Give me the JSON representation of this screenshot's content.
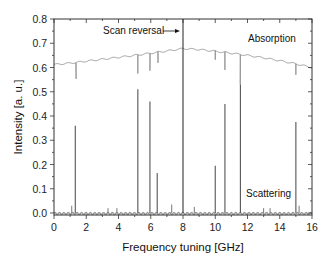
{
  "chart_data": {
    "type": "line",
    "title": "",
    "xlabel": "Frequency tuning [GHz]",
    "ylabel": "Intensity [a. u.]",
    "xlim": [
      0,
      16
    ],
    "ylim": [
      0.0,
      0.8
    ],
    "xticks": [
      "0",
      "2",
      "4",
      "6",
      "8",
      "10",
      "12",
      "14",
      "16"
    ],
    "yticks": [
      "0.0",
      "0.1",
      "0.2",
      "0.3",
      "0.4",
      "0.5",
      "0.6",
      "0.7",
      "0.8"
    ],
    "grid": false,
    "legend": null,
    "annotations": [
      {
        "text": "Scan reversal",
        "x": 8.0,
        "type": "vertical-line-with-arrow"
      },
      {
        "text": "Absorption",
        "x": 13.3,
        "y": 0.74
      },
      {
        "text": "Scattering",
        "x": 13.3,
        "y": 0.07
      }
    ],
    "series": [
      {
        "name": "Absorption",
        "baseline": {
          "x": [
            0,
            1,
            2,
            3,
            4,
            5,
            6,
            7,
            8,
            9,
            10,
            11,
            12,
            13,
            14,
            15,
            16
          ],
          "y": [
            0.612,
            0.618,
            0.626,
            0.634,
            0.642,
            0.65,
            0.659,
            0.668,
            0.678,
            0.674,
            0.667,
            0.659,
            0.65,
            0.64,
            0.628,
            0.615,
            0.6
          ]
        },
        "dips": [
          {
            "x": 1.37,
            "y": 0.553
          },
          {
            "x": 5.2,
            "y": 0.575
          },
          {
            "x": 5.95,
            "y": 0.587
          },
          {
            "x": 6.45,
            "y": 0.619
          },
          {
            "x": 10.0,
            "y": 0.632
          },
          {
            "x": 10.6,
            "y": 0.59
          },
          {
            "x": 11.55,
            "y": 0.53
          },
          {
            "x": 15.0,
            "y": 0.57
          }
        ]
      },
      {
        "name": "Scattering",
        "baseline": 0.0,
        "peaks": [
          {
            "x": 1.1,
            "y": 0.03
          },
          {
            "x": 1.32,
            "y": 0.36
          },
          {
            "x": 3.35,
            "y": 0.02
          },
          {
            "x": 3.9,
            "y": 0.02
          },
          {
            "x": 5.2,
            "y": 0.51
          },
          {
            "x": 5.95,
            "y": 0.46
          },
          {
            "x": 6.4,
            "y": 0.165
          },
          {
            "x": 7.3,
            "y": 0.035
          },
          {
            "x": 8.7,
            "y": 0.025
          },
          {
            "x": 10.0,
            "y": 0.195
          },
          {
            "x": 10.6,
            "y": 0.45
          },
          {
            "x": 11.56,
            "y": 0.53
          },
          {
            "x": 13.0,
            "y": 0.02
          },
          {
            "x": 13.4,
            "y": 0.02
          },
          {
            "x": 15.0,
            "y": 0.375
          },
          {
            "x": 15.2,
            "y": 0.03
          }
        ]
      }
    ],
    "scan_reversal_x": 8.0
  },
  "labels": {
    "xlabel": "Frequency tuning [GHz]",
    "ylabel": "Intensity [a. u.]",
    "scan_reversal": "Scan reversal",
    "absorption": "Absorption",
    "scattering": "Scattering"
  },
  "colors": {
    "frame": "#333333",
    "absorption_line": "#8a8a8a",
    "scattering_line": "#555555",
    "scan_line": "#222222"
  }
}
